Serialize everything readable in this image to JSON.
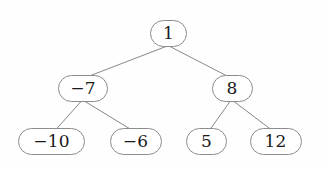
{
  "diagram": {
    "background_color": "#fefefe",
    "node_stroke_color": "#8c8c8c",
    "node_fill_color": "#ffffff",
    "edge_color": "#7a7a7a",
    "text_color": "#1a1a1a"
  },
  "nodes": [
    {
      "id": "root",
      "label": "1",
      "cx": 168.5,
      "cy": 33.5,
      "w": 37,
      "h": 27,
      "font_size": 17
    },
    {
      "id": "n-7",
      "label": "−7",
      "cx": 83.0,
      "cy": 88.5,
      "w": 50,
      "h": 27,
      "font_size": 17
    },
    {
      "id": "n8",
      "label": "8",
      "cx": 232.0,
      "cy": 88.5,
      "w": 41,
      "h": 27,
      "font_size": 17
    },
    {
      "id": "n-10",
      "label": "−10",
      "cx": 51.5,
      "cy": 141.5,
      "w": 67,
      "h": 27,
      "font_size": 17
    },
    {
      "id": "n-6",
      "label": "−6",
      "cx": 135.5,
      "cy": 141.5,
      "w": 52,
      "h": 27,
      "font_size": 17
    },
    {
      "id": "n5",
      "label": "5",
      "cx": 206.5,
      "cy": 141.5,
      "w": 41,
      "h": 27,
      "font_size": 17
    },
    {
      "id": "n12",
      "label": "12",
      "cx": 275.5,
      "cy": 141.5,
      "w": 52,
      "h": 27,
      "font_size": 17
    }
  ],
  "edges": [
    {
      "id": "root-to-n-7",
      "from": "root",
      "to": "n-7",
      "x1": 166.0,
      "y1": 46.5,
      "x2": 88.0,
      "y2": 76.5
    },
    {
      "id": "root-to-n8",
      "from": "root",
      "to": "n8",
      "x1": 170.0,
      "y1": 46.5,
      "x2": 228.0,
      "y2": 76.5
    },
    {
      "id": "n-7-to-n-10",
      "from": "n-7",
      "to": "n-10",
      "x1": 81.0,
      "y1": 101.5,
      "x2": 56.0,
      "y2": 129.5
    },
    {
      "id": "n-7-to-n-6",
      "from": "n-7",
      "to": "n-6",
      "x1": 85.0,
      "y1": 101.5,
      "x2": 131.0,
      "y2": 129.5
    },
    {
      "id": "n8-to-n5",
      "from": "n8",
      "to": "n5",
      "x1": 230.0,
      "y1": 101.5,
      "x2": 210.0,
      "y2": 129.5
    },
    {
      "id": "n8-to-n12",
      "from": "n8",
      "to": "n12",
      "x1": 234.0,
      "y1": 101.5,
      "x2": 271.0,
      "y2": 129.5
    }
  ],
  "chart_data": {
    "type": "diagram",
    "subtype": "binary-tree",
    "title": "",
    "levels": [
      {
        "depth": 0,
        "values": [
          "1"
        ]
      },
      {
        "depth": 1,
        "values": [
          "−7",
          "8"
        ]
      },
      {
        "depth": 2,
        "values": [
          "−10",
          "−6",
          "5",
          "12"
        ]
      }
    ],
    "links": [
      [
        "1",
        "−7"
      ],
      [
        "1",
        "8"
      ],
      [
        "−7",
        "−10"
      ],
      [
        "−7",
        "−6"
      ],
      [
        "8",
        "5"
      ],
      [
        "8",
        "12"
      ]
    ]
  }
}
